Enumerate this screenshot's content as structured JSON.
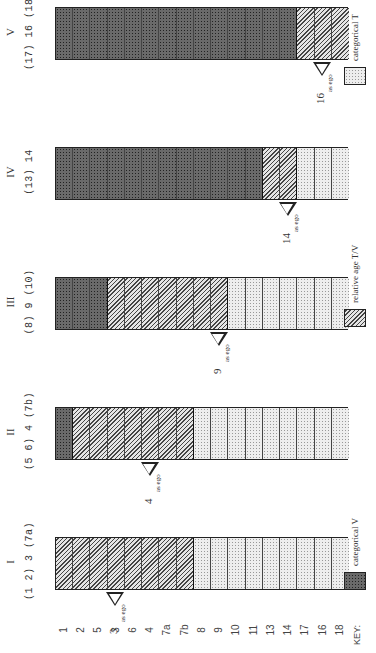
{
  "key": {
    "label": "KEY:",
    "items": [
      {
        "pattern": "V",
        "label": "categorical V"
      },
      {
        "pattern": "TV",
        "label": "relative age T/V"
      },
      {
        "pattern": "T",
        "label": "categorical T"
      }
    ]
  },
  "row_labels": [
    "1",
    "2",
    "5",
    "3",
    "6",
    "4",
    "7a",
    "7b",
    "8",
    "9",
    "10",
    "11",
    "13",
    "14",
    "17",
    "16",
    "18"
  ],
  "panels": [
    {
      "title": "I",
      "members": "(1 2) 3 (7a)",
      "segments": {
        "V": 0,
        "TV": 8,
        "T": 9
      },
      "ego": {
        "number": "3",
        "row_index": 3,
        "label": "as ego"
      }
    },
    {
      "title": "II",
      "members": "(5 6) 4 (7b)",
      "segments": {
        "V": 1,
        "TV": 7,
        "T": 9
      },
      "ego": {
        "number": "4",
        "row_index": 5,
        "label": "as ego"
      }
    },
    {
      "title": "III",
      "members": "(8) 9 (10)",
      "segments": {
        "V": 3,
        "TV": 7,
        "T": 7
      },
      "ego": {
        "number": "9",
        "row_index": 9,
        "label": "as ego"
      }
    },
    {
      "title": "IV",
      "members": "(13) 14",
      "segments": {
        "V": 12,
        "TV": 2,
        "T": 3
      },
      "ego": {
        "number": "14",
        "row_index": 13,
        "label": "as ego"
      }
    },
    {
      "title": "V",
      "members": "(17) 16 (18)",
      "segments": {
        "V": 14,
        "TV": 3,
        "T": 0
      },
      "ego": {
        "number": "16",
        "row_index": 15,
        "label": "as ego"
      }
    }
  ]
}
